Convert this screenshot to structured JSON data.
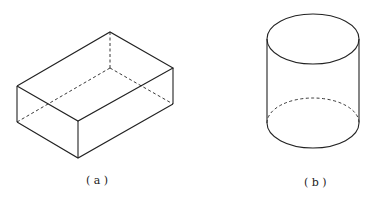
{
  "figures": [
    {
      "id": "a",
      "label": "( a )",
      "shape": "rectangular-cuboid"
    },
    {
      "id": "b",
      "label": "( b )",
      "shape": "cylinder"
    }
  ],
  "colors": {
    "stroke": "#222222",
    "background": "#ffffff"
  }
}
